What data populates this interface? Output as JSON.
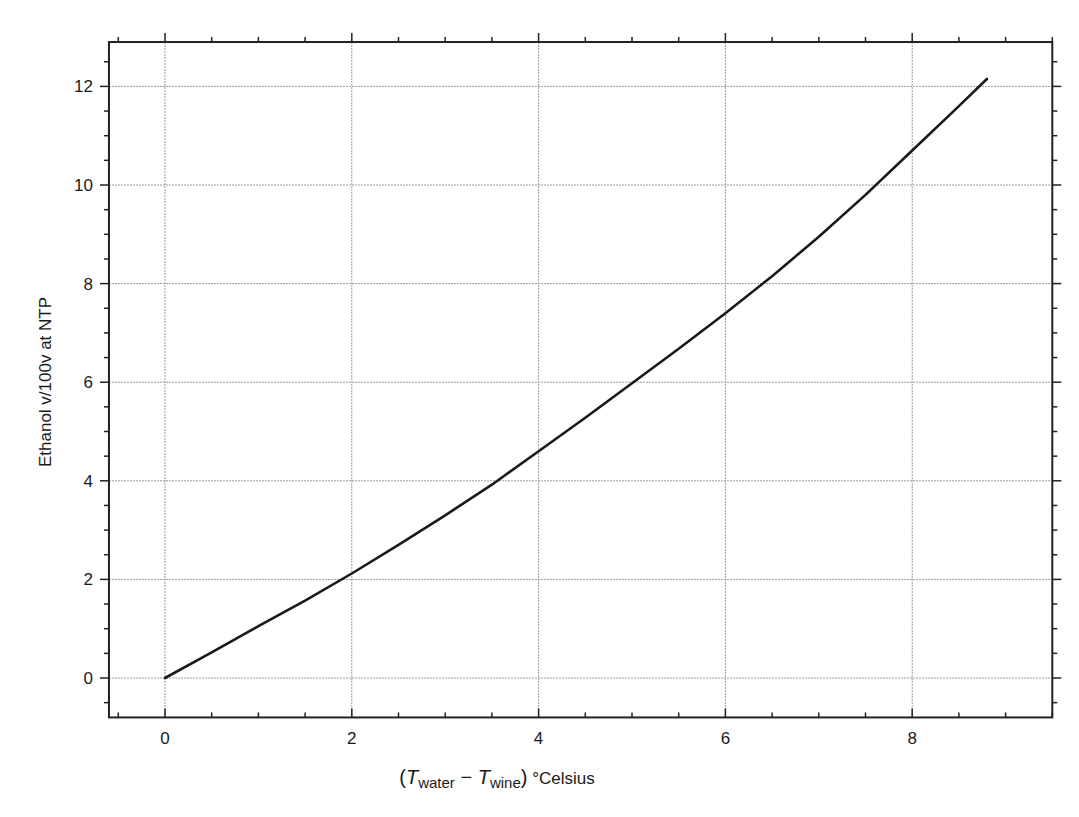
{
  "chart_data": {
    "type": "line",
    "title": "",
    "xlabel": "(T_water − T_wine) °Celsius",
    "xlabel_parts": {
      "open": "(",
      "t1": "T",
      "sub1": "water",
      "minus": " − ",
      "t2": "T",
      "sub2": "wine",
      "close": ")",
      "unit": " °Celsius"
    },
    "ylabel": "Ethanol v/100v at NTP",
    "xlim": [
      -0.6,
      9.5
    ],
    "ylim": [
      -0.8,
      12.9
    ],
    "x_ticks": [
      0,
      2,
      4,
      6,
      8
    ],
    "x_tick_labels": [
      "0",
      "2",
      "4",
      "6",
      "8"
    ],
    "y_ticks": [
      0,
      2,
      4,
      6,
      8,
      10,
      12
    ],
    "y_tick_labels": [
      "0",
      "2",
      "4",
      "6",
      "8",
      "10",
      "12"
    ],
    "x_minor_step": 0.5,
    "y_minor_step": 0.5,
    "grid": true,
    "legend": null,
    "series": [
      {
        "name": "Ethanol content",
        "color": "#1a1a1a",
        "x": [
          0,
          0.5,
          1.0,
          1.5,
          2.0,
          2.5,
          3.0,
          3.5,
          4.0,
          4.5,
          5.0,
          5.5,
          6.0,
          6.5,
          7.0,
          7.5,
          8.0,
          8.5,
          8.8
        ],
        "y": [
          0,
          0.52,
          1.05,
          1.57,
          2.12,
          2.7,
          3.3,
          3.92,
          4.6,
          5.28,
          5.98,
          6.68,
          7.4,
          8.15,
          8.95,
          9.8,
          10.7,
          11.6,
          12.15
        ]
      }
    ]
  }
}
